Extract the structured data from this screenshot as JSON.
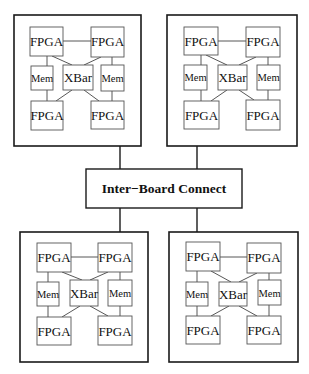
{
  "diagram": {
    "type": "block-diagram",
    "interconnect": {
      "label": "Inter−Board Connect",
      "x": 86,
      "y": 169,
      "w": 156,
      "h": 39
    },
    "boards": [
      {
        "id": "board-top-left",
        "x": 14,
        "y": 15,
        "w": 127,
        "h": 131,
        "connector": {
          "x": 120,
          "y1": 146,
          "y2": 169
        },
        "components": {
          "fpga_tl": "FPGA",
          "fpga_tr": "FPGA",
          "mem_l": "Mem",
          "xbar": "XBar",
          "mem_r": "Mem",
          "fpga_bl": "FPGA",
          "fpga_br": "FPGA"
        }
      },
      {
        "id": "board-top-right",
        "x": 167,
        "y": 15,
        "w": 130,
        "h": 131,
        "connector": {
          "x": 197,
          "y1": 146,
          "y2": 169
        },
        "components": {
          "fpga_tl": "FPGA",
          "fpga_tr": "FPGA",
          "mem_l": "Mem",
          "xbar": "XBar",
          "mem_r": "Mem",
          "fpga_bl": "FPGA",
          "fpga_br": "FPGA"
        }
      },
      {
        "id": "board-bottom-left",
        "x": 20,
        "y": 232,
        "w": 128,
        "h": 130,
        "connector": {
          "x": 120,
          "y1": 208,
          "y2": 232
        },
        "components": {
          "fpga_tl": "FPGA",
          "fpga_tr": "FPGA",
          "mem_l": "Mem",
          "xbar": "XBar",
          "mem_r": "Mem",
          "fpga_bl": "FPGA",
          "fpga_br": "FPGA"
        }
      },
      {
        "id": "board-bottom-right",
        "x": 169,
        "y": 232,
        "w": 129,
        "h": 130,
        "connector": {
          "x": 197,
          "y1": 208,
          "y2": 232
        },
        "components": {
          "fpga_tl": "FPGA",
          "fpga_tr": "FPGA",
          "mem_l": "Mem",
          "xbar": "XBar",
          "mem_r": "Mem",
          "fpga_bl": "FPGA",
          "fpga_br": "FPGA"
        }
      }
    ],
    "edges": [
      "fpga_tl-fpga_tr",
      "fpga_tl-mem_l",
      "mem_l-fpga_bl",
      "fpga_tr-mem_r",
      "mem_r-fpga_br",
      "fpga_tl-xbar",
      "fpga_tr-xbar",
      "fpga_bl-xbar",
      "fpga_br-xbar",
      "board-top-left-interconnect",
      "board-top-right-interconnect",
      "board-bottom-left-interconnect",
      "board-bottom-right-interconnect"
    ]
  }
}
